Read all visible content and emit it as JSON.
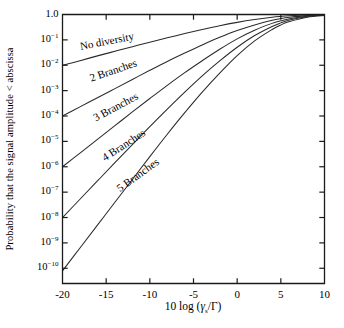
{
  "chart_data": {
    "type": "line",
    "title": "",
    "xlabel": "10 log (γs/Γ)",
    "ylabel": "Probability that the signal amplitude < abscissa",
    "xlim": [
      -20,
      10
    ],
    "ylim_log10": [
      -10.6,
      0
    ],
    "yscale": "log",
    "grid": false,
    "legend": "inline-curve-labels",
    "xticks": [
      -20,
      -15,
      -10,
      -5,
      0,
      5,
      10
    ],
    "xtick_labels": [
      "-20",
      "-15",
      "-10",
      "-5",
      "0",
      "5",
      "10"
    ],
    "ytick_exponents": [
      0,
      -1,
      -2,
      -3,
      -4,
      -5,
      -6,
      -7,
      -8,
      -9,
      -10
    ],
    "ytick_labels": [
      "1.0",
      "10-1",
      "10-2",
      "10-3",
      "10-4",
      "10-5",
      "10-6",
      "10-7",
      "10-8",
      "10-9",
      "10-10"
    ],
    "series": [
      {
        "name": "No diversity",
        "label": "No diversity",
        "label_x": -18.0,
        "label_y_exp": -1.3,
        "label_angle": -11,
        "x": [
          -20,
          -18,
          -16,
          -14,
          -12,
          -10,
          -8,
          -6,
          -4,
          -2,
          0,
          2,
          4,
          5,
          6,
          8,
          10
        ],
        "y_exp": [
          -2.0,
          -1.82,
          -1.63,
          -1.45,
          -1.27,
          -1.09,
          -0.92,
          -0.75,
          -0.59,
          -0.44,
          -0.31,
          -0.2,
          -0.11,
          -0.075,
          -0.05,
          -0.02,
          -0.008
        ]
      },
      {
        "name": "2 Branches",
        "label": "2 Branches",
        "label_x": -16.8,
        "label_y_exp": -2.55,
        "label_angle": -19,
        "x": [
          -20,
          -18,
          -16,
          -14,
          -12,
          -10,
          -8,
          -6,
          -4,
          -2,
          0,
          2,
          4,
          5,
          6,
          8,
          10
        ],
        "y_exp": [
          -4.0,
          -3.64,
          -3.28,
          -2.92,
          -2.56,
          -2.2,
          -1.85,
          -1.52,
          -1.2,
          -0.9,
          -0.63,
          -0.41,
          -0.23,
          -0.16,
          -0.11,
          -0.045,
          -0.016
        ]
      },
      {
        "name": "3 Branches",
        "label": "3 Branches",
        "label_x": -16.4,
        "label_y_exp": -4.1,
        "label_angle": -28,
        "x": [
          -20,
          -18,
          -16,
          -14,
          -12,
          -10,
          -8,
          -6,
          -4,
          -2,
          0,
          2,
          4,
          5,
          6,
          8,
          10
        ],
        "y_exp": [
          -6.0,
          -5.46,
          -4.92,
          -4.38,
          -3.84,
          -3.31,
          -2.79,
          -2.29,
          -1.82,
          -1.37,
          -0.96,
          -0.62,
          -0.35,
          -0.25,
          -0.17,
          -0.07,
          -0.025
        ]
      },
      {
        "name": "4 Branches",
        "label": "4 Branches",
        "label_x": -15.4,
        "label_y_exp": -5.7,
        "label_angle": -33,
        "x": [
          -20,
          -18,
          -16,
          -14,
          -12,
          -10,
          -8,
          -6,
          -4,
          -2,
          0,
          2,
          4,
          5,
          6,
          8,
          10
        ],
        "y_exp": [
          -8.0,
          -7.28,
          -6.56,
          -5.84,
          -5.13,
          -4.42,
          -3.73,
          -3.06,
          -2.42,
          -1.83,
          -1.29,
          -0.83,
          -0.47,
          -0.33,
          -0.22,
          -0.09,
          -0.033
        ]
      },
      {
        "name": "5 Branches",
        "label": "5 Branches",
        "label_x": -13.6,
        "label_y_exp": -6.9,
        "label_angle": -36,
        "x": [
          -20,
          -18,
          -16,
          -14,
          -12,
          -10,
          -8,
          -6,
          -4,
          -2,
          0,
          2,
          4,
          5,
          6,
          8,
          10
        ],
        "y_exp": [
          -10.1,
          -9.2,
          -8.3,
          -7.4,
          -6.5,
          -5.6,
          -4.72,
          -3.87,
          -3.06,
          -2.31,
          -1.62,
          -1.04,
          -0.59,
          -0.41,
          -0.28,
          -0.11,
          -0.04
        ]
      }
    ],
    "colors": {
      "axis": "#1a1a1a",
      "curve": "#2a2a2a",
      "background": "#ffffff",
      "text": "#000000"
    }
  },
  "caption": {
    "text": ""
  }
}
